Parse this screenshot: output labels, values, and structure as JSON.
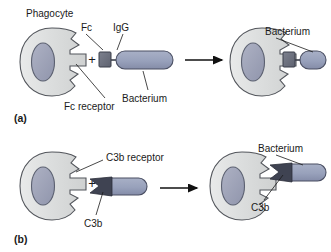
{
  "figure": {
    "title_visible": false,
    "width": 331,
    "height": 252,
    "background": "#ffffff"
  },
  "colors": {
    "cell_fill": "#d9dbdb",
    "cell_fill_light": "#e4e6e6",
    "cell_stroke": "#53565c",
    "nucleus_fill": "#9ea3b8",
    "nucleus_stroke": "#5b6070",
    "bacterium_fill": "#9aa3bd",
    "bacterium_stroke": "#4a4f63",
    "fc_fill": "#6e727f",
    "fc_stroke": "#3b3f4a",
    "c3b_fill": "#3f4352",
    "text": "#1a1a1a",
    "leader_line": "#1a1a1a",
    "arrow": "#111111"
  },
  "panels": [
    {
      "id": "panel-a",
      "label": "(a)",
      "mechanism": "Fc receptor mediated opsonization",
      "labels": {
        "phagocyte": "Phagocyte",
        "fc": "Fc",
        "igg": "IgG",
        "bacterium_left": "Bacterium",
        "fc_receptor": "Fc receptor",
        "bacterium_right": "Bacterium",
        "plus": "+"
      }
    },
    {
      "id": "panel-b",
      "label": "(b)",
      "mechanism": "C3b receptor mediated opsonization",
      "labels": {
        "c3b_receptor": "C3b receptor",
        "c3b_left": "C3b",
        "bacterium_right": "Bacterium",
        "c3b_right": "C3b",
        "plus": "+"
      }
    }
  ]
}
